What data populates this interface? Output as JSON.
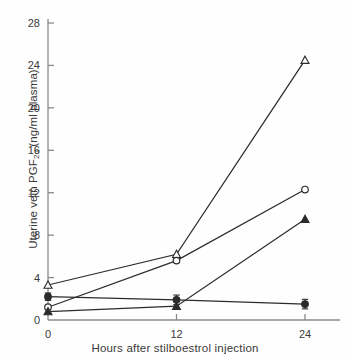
{
  "chart_data": {
    "type": "line",
    "title": "",
    "xlabel": "Hours after stilboestrol injection",
    "ylabel": "Uterine vein PGF2α (ng/ml plasma)",
    "ylabel_main": "Uterine vein PGF",
    "ylabel_sub": "2α",
    "ylabel_units": " (ng/ml plasma)",
    "x": [
      0,
      12,
      24
    ],
    "xticks": [
      "0",
      "12",
      "24"
    ],
    "yticks": [
      "0",
      "4",
      "8",
      "12",
      "16",
      "20",
      "24",
      "28"
    ],
    "xlim": [
      0,
      26
    ],
    "ylim": [
      0,
      28
    ],
    "grid": false,
    "legend": "none",
    "series": [
      {
        "name": "open-triangle",
        "marker": "open-triangle",
        "values": [
          3.3,
          6.2,
          24.5
        ],
        "errors": [
          0,
          0,
          0
        ]
      },
      {
        "name": "open-circle",
        "marker": "open-circle",
        "values": [
          1.2,
          5.6,
          12.3
        ],
        "errors": [
          0,
          0,
          0
        ]
      },
      {
        "name": "filled-triangle",
        "marker": "filled-triangle",
        "values": [
          0.8,
          1.3,
          9.5
        ],
        "errors": [
          0,
          0,
          0
        ]
      },
      {
        "name": "filled-circle",
        "marker": "filled-circle",
        "values": [
          2.2,
          1.9,
          1.5
        ],
        "errors": [
          0.35,
          0.45,
          0.45
        ]
      }
    ],
    "colors": {
      "line": "#2b2b2b",
      "axis": "#8a8a8a",
      "text": "#3a3a3a",
      "background": "#fefefe"
    }
  }
}
